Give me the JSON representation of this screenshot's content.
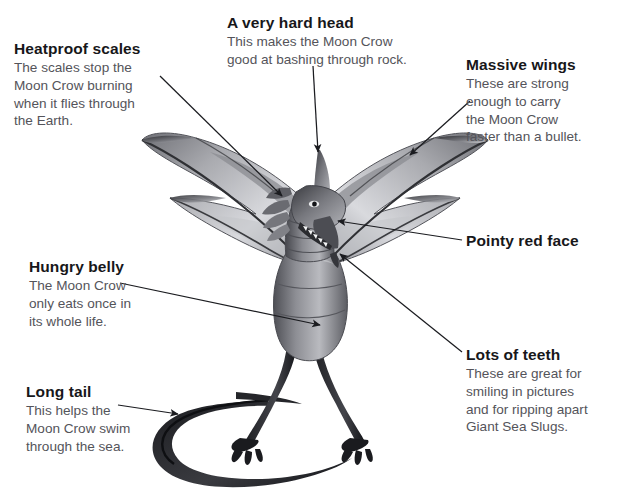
{
  "figure": {
    "subject": "Moon Crow",
    "background_color": "#ffffff",
    "heading_color": "#17171a",
    "body_color": "#54545a",
    "illustration": "pencil-drawn winged dragon creature, front-facing, wings spread, standing on two clawed legs with long curling tail"
  },
  "callouts": [
    {
      "id": "heatproof-scales",
      "title": "Heatproof scales",
      "lines": [
        "The scales stop the",
        "Moon Crow burning",
        "when it flies through",
        "the Earth."
      ]
    },
    {
      "id": "a-very-hard-head",
      "title": "A very hard head",
      "lines": [
        "This makes the Moon Crow",
        "good at bashing through rock."
      ]
    },
    {
      "id": "massive-wings",
      "title": "Massive wings",
      "lines": [
        "These are strong",
        "enough to carry",
        "the Moon Crow",
        "faster than a bullet."
      ]
    },
    {
      "id": "pointy-red-face",
      "title": "Pointy red face",
      "lines": []
    },
    {
      "id": "lots-of-teeth",
      "title": "Lots of teeth",
      "lines": [
        "These are great for",
        "smiling in pictures",
        "and for ripping apart",
        "Giant Sea Slugs."
      ]
    },
    {
      "id": "hungry-belly",
      "title": "Hungry belly",
      "lines": [
        "The Moon Crow",
        "only eats once in",
        "its whole life."
      ]
    },
    {
      "id": "long-tail",
      "title": "Long tail",
      "lines": [
        "This helps the",
        "Moon Crow swim",
        "through the sea."
      ]
    }
  ]
}
